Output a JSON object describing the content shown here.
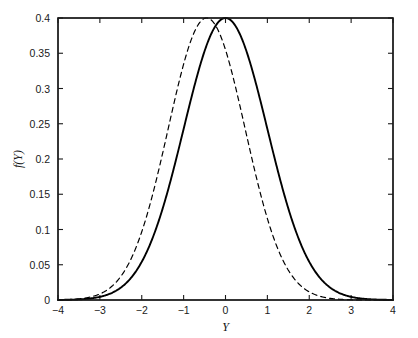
{
  "chart_data": {
    "type": "line",
    "title": "",
    "subtitle": "",
    "xlabel": "Y",
    "ylabel": "f(Y)",
    "xlim": [
      -4,
      4
    ],
    "ylim": [
      0,
      0.4
    ],
    "xticks": [
      -4,
      -3,
      -2,
      -1,
      0,
      1,
      2,
      3,
      4
    ],
    "xtick_labels": [
      "−4",
      "−3",
      "−2",
      "−1",
      "0",
      "1",
      "2",
      "3",
      "4"
    ],
    "yticks": [
      0,
      0.05,
      0.1,
      0.15,
      0.2,
      0.25,
      0.3,
      0.35,
      0.4
    ],
    "ytick_labels": [
      "0",
      "0.05",
      "0.1",
      "0.15",
      "0.2",
      "0.25",
      "0.3",
      "0.35",
      "0.4"
    ],
    "grid": false,
    "legend": "none",
    "box": true,
    "background": "#ffffff",
    "series": [
      {
        "name": "solid-normal-curve",
        "style": "solid",
        "color": "#000000",
        "linewidth": 1.9,
        "mean": 0,
        "sigma": 1,
        "peak": 0.4,
        "x": [
          -4,
          -3.8,
          -3.6,
          -3.4,
          -3.2,
          -3,
          -2.8,
          -2.6,
          -2.4,
          -2.2,
          -2,
          -1.8,
          -1.6,
          -1.4,
          -1.2,
          -1,
          -0.8,
          -0.6,
          -0.4,
          -0.2,
          0,
          0.2,
          0.4,
          0.6,
          0.8,
          1,
          1.2,
          1.4,
          1.6,
          1.8,
          2,
          2.2,
          2.4,
          2.6,
          2.8,
          3,
          3.2,
          3.4,
          3.6,
          3.8,
          4
        ],
        "values": [
          0.0001,
          0.0003,
          0.0006,
          0.0012,
          0.0024,
          0.0044,
          0.0079,
          0.0136,
          0.0224,
          0.0355,
          0.054,
          0.079,
          0.1109,
          0.1497,
          0.1942,
          0.242,
          0.2897,
          0.3332,
          0.3683,
          0.391,
          0.3989,
          0.391,
          0.3683,
          0.3332,
          0.2897,
          0.242,
          0.1942,
          0.1497,
          0.1109,
          0.079,
          0.054,
          0.0355,
          0.0224,
          0.0136,
          0.0079,
          0.0044,
          0.0024,
          0.0012,
          0.0006,
          0.0003,
          0.0001
        ]
      },
      {
        "name": "dashed-normal-curve",
        "style": "dashed",
        "color": "#000000",
        "linewidth": 1.2,
        "mean": -0.45,
        "sigma": 0.92,
        "peak": 0.4,
        "x": [
          -4,
          -3.8,
          -3.6,
          -3.4,
          -3.2,
          -3,
          -2.8,
          -2.6,
          -2.4,
          -2.2,
          -2,
          -1.8,
          -1.6,
          -1.4,
          -1.2,
          -1,
          -0.8,
          -0.6,
          -0.45,
          -0.2,
          0,
          0.2,
          0.4,
          0.6,
          0.8,
          1,
          1.2,
          1.4,
          1.6,
          1.8,
          2,
          2.2,
          2.4,
          2.6,
          2.8,
          3,
          3.2,
          3.4,
          3.6,
          3.8,
          4
        ],
        "values": [
          0.0002,
          0.0005,
          0.0011,
          0.0022,
          0.0042,
          0.0078,
          0.0139,
          0.0238,
          0.0391,
          0.0619,
          0.094,
          0.1372,
          0.1924,
          0.2592,
          0.3354,
          0.4172,
          0.3989,
          0.4302,
          0.4336,
          0.4029,
          0.3502,
          0.2883,
          0.2272,
          0.1715,
          0.1242,
          0.0863,
          0.0576,
          0.0369,
          0.0227,
          0.0134,
          0.0076,
          0.0041,
          0.0021,
          0.0011,
          0.0005,
          0.0002,
          0.0001,
          0.0,
          0.0,
          0.0,
          0.0
        ]
      }
    ]
  },
  "figure": {
    "axis_color": "#1a1a1a",
    "curve_color": "#000000"
  }
}
